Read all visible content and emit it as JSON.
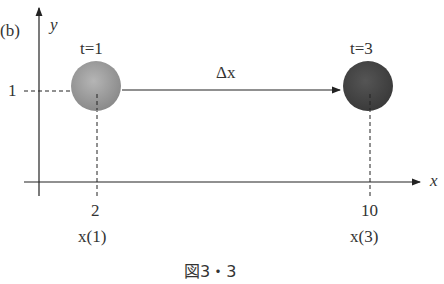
{
  "figure": {
    "panel_label": "(b)",
    "caption": "図3・3",
    "axes": {
      "x_label": "x",
      "y_label": "y"
    },
    "y_tick": "1",
    "displacement_label": "Δx",
    "objects": [
      {
        "time_label": "t=1",
        "x_value": "2",
        "x_func": "x(1)",
        "color": "#9a9a9a"
      },
      {
        "time_label": "t=3",
        "x_value": "10",
        "x_func": "x(3)",
        "color": "#4a4a4a"
      }
    ]
  }
}
